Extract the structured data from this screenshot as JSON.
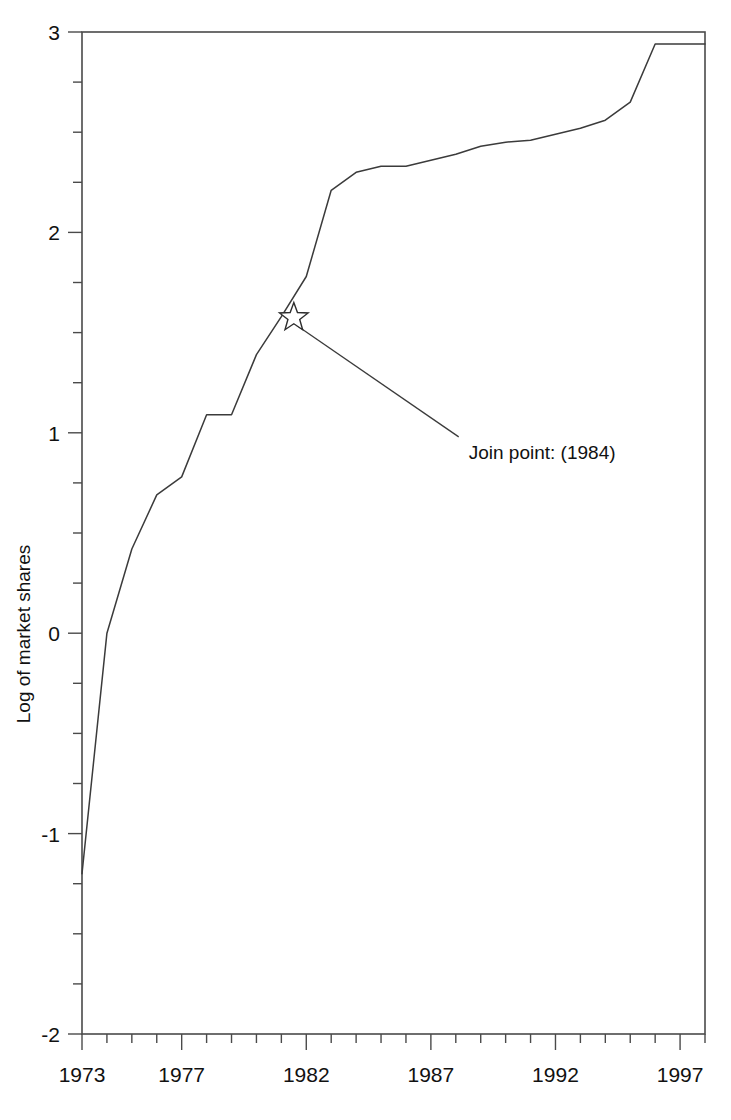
{
  "chart_data": {
    "type": "line",
    "title": "",
    "subtitle": "",
    "xlabel": "",
    "ylabel": "Log of market shares",
    "xlim": [
      1973,
      1998
    ],
    "ylim": [
      -2,
      3
    ],
    "grid": false,
    "legend": null,
    "x_ticks_major": [
      1973,
      1977,
      1982,
      1987,
      1992,
      1997
    ],
    "x_tick_labels": [
      "1973",
      "1977",
      "1982",
      "1987",
      "1992",
      "1997"
    ],
    "x_ticks_minor": [
      1974,
      1975,
      1976,
      1978,
      1979,
      1980,
      1981,
      1983,
      1984,
      1985,
      1986,
      1988,
      1989,
      1990,
      1991,
      1993,
      1994,
      1995,
      1996,
      1998
    ],
    "y_ticks_major": [
      -2,
      -1,
      0,
      1,
      2,
      3
    ],
    "y_tick_labels": [
      "-2",
      "-1",
      "0",
      "1",
      "2",
      "3"
    ],
    "y_ticks_minor": [
      -1.75,
      -1.5,
      -1.25,
      -0.75,
      -0.5,
      -0.25,
      0.25,
      0.5,
      0.75,
      1.25,
      1.5,
      1.75,
      2.25,
      2.5,
      2.75
    ],
    "series": [
      {
        "name": "Log of market shares",
        "x": [
          1973.0,
          1974.0,
          1975.0,
          1976.0,
          1977.0,
          1978.0,
          1979.0,
          1980.0,
          1981.0,
          1982.0,
          1983.0,
          1984.0,
          1985.0,
          1986.0,
          1987.0,
          1988.0,
          1989.0,
          1990.0,
          1991.0,
          1992.0,
          1993.0,
          1994.0,
          1995.0,
          1996.0,
          1997.0,
          1998.0
        ],
        "y": [
          -1.2,
          0.0,
          0.42,
          0.69,
          0.78,
          1.09,
          1.09,
          1.39,
          1.58,
          1.78,
          2.21,
          2.3,
          2.33,
          2.33,
          2.36,
          2.39,
          2.43,
          2.45,
          2.46,
          2.49,
          2.52,
          2.56,
          2.65,
          2.94,
          2.94,
          2.94
        ]
      }
    ],
    "annotations": [
      {
        "name": "join-point",
        "label": "Join point: (1984)",
        "marker": "star",
        "point_x": 1981.5,
        "point_y": 1.575,
        "text_x": 1989.0,
        "text_y": 0.87
      }
    ]
  },
  "axes": {
    "y_axis_title": "Log of market shares"
  }
}
